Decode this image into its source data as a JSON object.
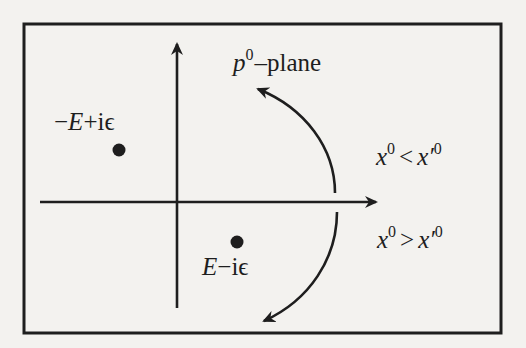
{
  "diagram": {
    "title_label": {
      "base": "p",
      "superscript": "0",
      "suffix": "–plane"
    },
    "poles": [
      {
        "id": "upper-pole",
        "label_parts": [
          "−",
          "E",
          "+iϵ"
        ],
        "position": "second quadrant (above real axis, left of imaginary axis)"
      },
      {
        "id": "lower-pole",
        "label_parts": [
          "E",
          "−iϵ"
        ],
        "position": "fourth quadrant (below real axis, right of imaginary axis)"
      }
    ],
    "contour_labels": {
      "upper": {
        "lhs": "x",
        "lhs_sup": "0",
        "op": "<",
        "rhs": "x′",
        "rhs_sup": "0"
      },
      "lower": {
        "lhs": "x",
        "lhs_sup": "0",
        "op": ">",
        "rhs": "x′",
        "rhs_sup": "0"
      }
    },
    "colors": {
      "background": "#f3f2ef",
      "ink": "#1e1e1e"
    }
  }
}
